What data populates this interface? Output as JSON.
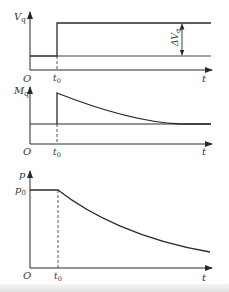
{
  "figure": {
    "panels": [
      {
        "id": "valve-opening",
        "y_label": "V",
        "y_label_sub": "q",
        "x_label": "t",
        "origin_label": "O",
        "t0_label": "t",
        "t0_sub": "0",
        "delta_label": "ΔV",
        "delta_sub": "q",
        "shape": "step increase at t0"
      },
      {
        "id": "torque",
        "y_label": "M",
        "y_label_sub": "q",
        "x_label": "t",
        "origin_label": "O",
        "t0_label": "t",
        "t0_sub": "0",
        "shape": "jump at t0 then exponential decay back to baseline"
      },
      {
        "id": "pressure",
        "y_label": "p",
        "x_label": "t",
        "origin_label": "O",
        "t0_label": "t",
        "t0_sub": "0",
        "level_label": "p",
        "level_sub": "0",
        "shape": "constant p0 until t0 then decreasing curve"
      }
    ],
    "colors": {
      "line": "#2a2a2a",
      "text": "#333333",
      "background": "#ffffff"
    }
  }
}
